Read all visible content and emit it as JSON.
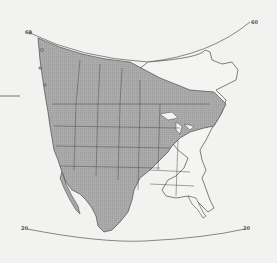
{
  "map": {
    "type": "range-map",
    "region": "North America",
    "latitude_labels": {
      "top_left": "60",
      "top_right": "60",
      "bottom_left": "20",
      "bottom_right": "20"
    },
    "legend_line": "",
    "colors": {
      "background": "#f2f2f0",
      "range_fill": "#a9a9a9",
      "land_fill": "#f4f4f2",
      "borders": "#4a4a4a",
      "graticule": "#6a6a6a"
    }
  }
}
